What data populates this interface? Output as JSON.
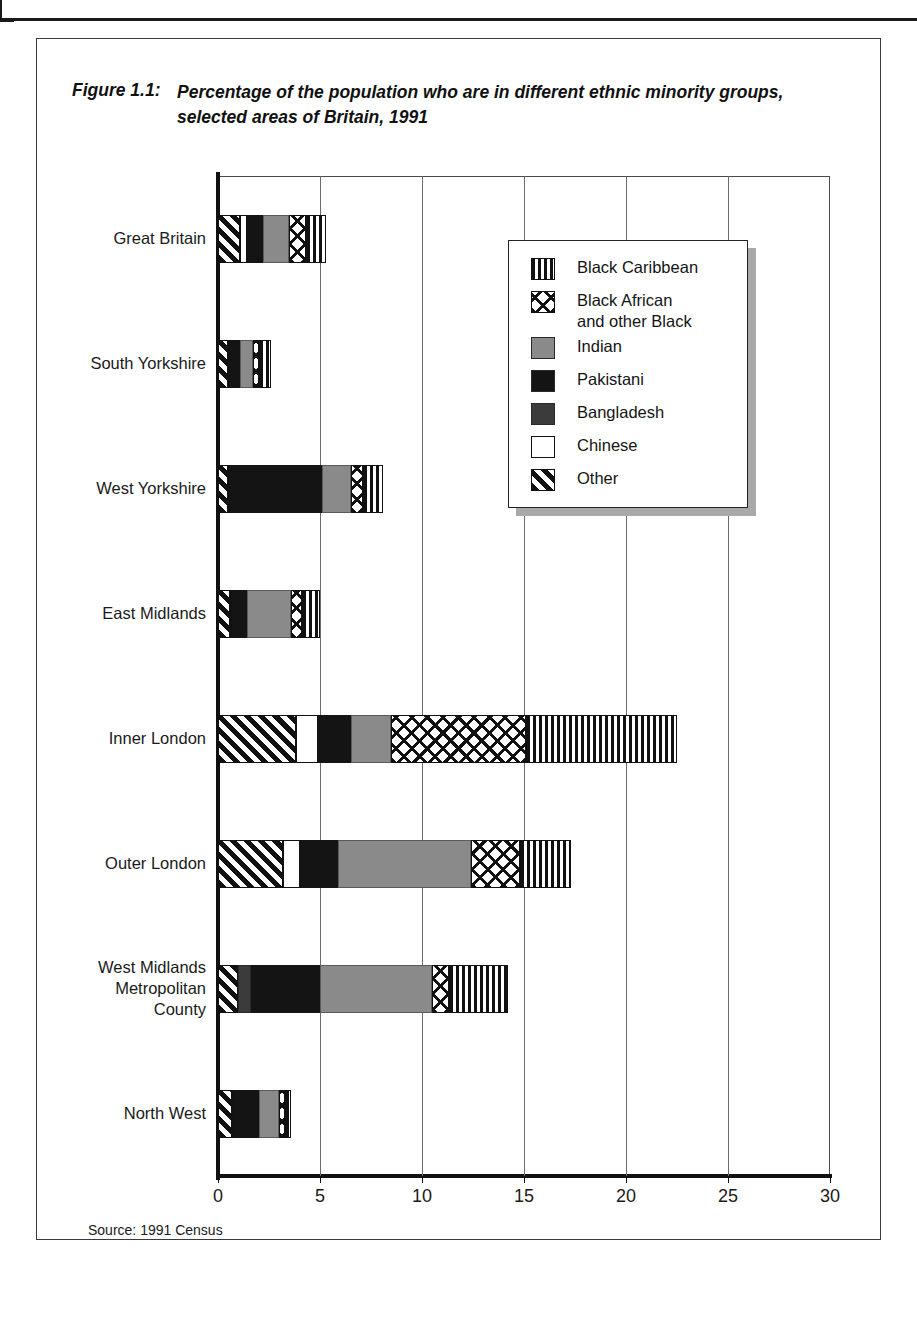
{
  "figure": {
    "label": "Figure 1.1:",
    "title": "Percentage of the population who are in different ethnic minority groups, selected areas of Britain, 1991",
    "source": "Source: 1991 Census"
  },
  "legend": {
    "position": "inside-top-right",
    "items": [
      {
        "key": "black_caribbean",
        "label": "Black Caribbean",
        "pattern": "vertical-stripes",
        "color": "#111111"
      },
      {
        "key": "black_african",
        "label": "Black African\nand other Black",
        "pattern": "sparse-cross-hatch",
        "color": "#ffffff"
      },
      {
        "key": "indian",
        "label": "Indian",
        "pattern": "solid",
        "color": "#8a8a8a"
      },
      {
        "key": "pakistani",
        "label": "Pakistani",
        "pattern": "solid",
        "color": "#141414"
      },
      {
        "key": "bangladesh",
        "label": "Bangladesh",
        "pattern": "solid",
        "color": "#3b3b3b"
      },
      {
        "key": "chinese",
        "label": "Chinese",
        "pattern": "empty",
        "color": "#ffffff"
      },
      {
        "key": "other",
        "label": "Other",
        "pattern": "diagonal-hatch",
        "color": "#111111"
      }
    ]
  },
  "chart_data": {
    "type": "bar",
    "orientation": "horizontal",
    "stacked": true,
    "title": "Percentage of the population who are in different ethnic minority groups, selected areas of Britain, 1991",
    "xlabel": "",
    "ylabel": "",
    "xlim": [
      0,
      30
    ],
    "xticks": [
      0,
      5,
      10,
      15,
      20,
      25,
      30
    ],
    "xticklabels": [
      "0",
      "5",
      "10",
      "15",
      "20",
      "25",
      "30"
    ],
    "grid": "vertical",
    "legend_position": "inside-top-right",
    "categories": [
      "Great Britain",
      "South Yorkshire",
      "West Yorkshire",
      "East Midlands",
      "Inner London",
      "Outer London",
      "West Midlands\nMetropolitan\nCounty",
      "North West"
    ],
    "series": [
      {
        "name": "Other",
        "values": [
          1.1,
          0.5,
          0.5,
          0.6,
          3.8,
          3.2,
          1.0,
          0.7
        ]
      },
      {
        "name": "Chinese",
        "values": [
          0.3,
          0.1,
          0.1,
          0.1,
          1.1,
          0.8,
          0.0,
          0.1
        ]
      },
      {
        "name": "Bangladesh",
        "values": [
          0.0,
          0.0,
          0.0,
          0.0,
          0.0,
          0.0,
          0.6,
          0.0
        ]
      },
      {
        "name": "Pakistani",
        "values": [
          0.8,
          0.5,
          4.5,
          0.7,
          1.6,
          1.9,
          3.4,
          1.2
        ]
      },
      {
        "name": "Indian",
        "values": [
          1.3,
          0.6,
          1.4,
          2.2,
          2.0,
          6.5,
          5.5,
          1.0
        ]
      },
      {
        "name": "Black African and other Black",
        "values": [
          0.8,
          0.3,
          0.6,
          0.5,
          6.6,
          2.4,
          0.8,
          0.3
        ]
      },
      {
        "name": "Black Caribbean",
        "values": [
          1.0,
          0.6,
          1.0,
          0.9,
          7.4,
          2.5,
          2.9,
          0.3
        ]
      }
    ],
    "totals": [
      5.3,
      2.6,
      8.1,
      5.0,
      26.1,
      17.2,
      14.2,
      3.6
    ],
    "units": "percent"
  }
}
